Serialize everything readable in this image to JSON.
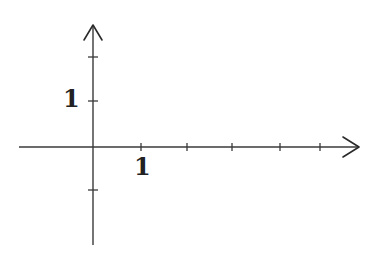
{
  "diagram": {
    "type": "cartesian-axes",
    "origin": {
      "x": 93,
      "y": 147
    },
    "unit_px": {
      "x": 47,
      "y": 46
    },
    "x_axis": {
      "from": 19,
      "to": 360,
      "ticks_x_px": [
        141,
        187,
        232,
        280,
        320
      ],
      "label": {
        "text": "1",
        "at_tick": 1
      }
    },
    "y_axis": {
      "from": 245,
      "to": 24,
      "ticks_y_px": [
        57,
        101,
        190
      ],
      "label": {
        "text": "1",
        "at_tick": 1
      }
    },
    "colors": {
      "line": "#3a3a3a",
      "text": "#222222",
      "background": "#ffffff"
    }
  }
}
